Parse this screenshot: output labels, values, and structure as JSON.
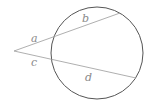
{
  "diagram": {
    "type": "two-secants-from-external-point",
    "circle": {
      "cx": 97,
      "cy": 53,
      "r": 46,
      "stroke": "#555555"
    },
    "external_point": {
      "x": 14,
      "y": 51
    },
    "secants": [
      {
        "name": "upper",
        "near_intersection": {
          "x": 54,
          "y": 37
        },
        "far_end": {
          "x": 120,
          "y": 13
        },
        "stroke": "#9a9a9a"
      },
      {
        "name": "lower",
        "near_intersection": {
          "x": 52,
          "y": 59
        },
        "far_end": {
          "x": 136,
          "y": 78
        },
        "stroke": "#9a9a9a"
      }
    ],
    "labels": {
      "a": "a",
      "b": "b",
      "c": "c",
      "d": "d"
    }
  }
}
